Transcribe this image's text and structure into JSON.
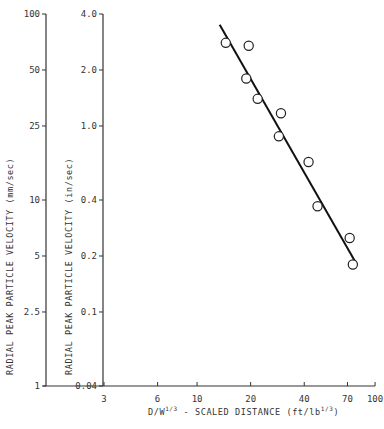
{
  "chart_data": {
    "type": "scatter",
    "title": "",
    "xlabel": "D/W^(1/3) - SCALED DISTANCE (ft/lb^(1/3))",
    "ylabel_left": "RADIAL PEAK PARTICLE VELOCITY (mm/sec)",
    "ylabel_right": "RADIAL PEAK PARTICLE VELOCITY (in/sec)",
    "xscale": "log",
    "yscale": "log",
    "xlim": [
      3,
      100
    ],
    "ylim_in_per_sec": [
      0.04,
      4.0
    ],
    "ylim_mm_per_sec": [
      1,
      100
    ],
    "x_ticks": [
      "3",
      "6",
      "10",
      "20",
      "40",
      "70",
      "100"
    ],
    "y_ticks_left": [
      "100",
      "50",
      "25",
      "10",
      "5",
      "2.5",
      "1"
    ],
    "y_ticks_right": [
      "4.0",
      "2.0",
      "1.0",
      "0.4",
      "0.2",
      "0.1",
      "0.04"
    ],
    "grid": false,
    "legend": null,
    "series": [
      {
        "name": "Measured data",
        "marker": "open-circle",
        "points": [
          {
            "x": 14.5,
            "y": 2.8
          },
          {
            "x": 19.5,
            "y": 2.7
          },
          {
            "x": 18.9,
            "y": 1.8
          },
          {
            "x": 21.9,
            "y": 1.4
          },
          {
            "x": 29.6,
            "y": 1.17
          },
          {
            "x": 28.8,
            "y": 0.88
          },
          {
            "x": 42.3,
            "y": 0.64
          },
          {
            "x": 47.5,
            "y": 0.37
          },
          {
            "x": 72.0,
            "y": 0.25
          },
          {
            "x": 75.0,
            "y": 0.18
          }
        ]
      },
      {
        "name": "Fit line",
        "type": "line",
        "points": [
          {
            "x": 13.4,
            "y": 3.5
          },
          {
            "x": 79,
            "y": 0.18
          }
        ]
      }
    ]
  },
  "labels": {
    "x_axis_prefix": "D/W",
    "x_axis_exp": "1/3",
    "x_axis_mid": " - SCALED DISTANCE (ft/lb",
    "x_axis_suffix": ")",
    "y_left": "RADIAL PEAK PARTICLE VELOCITY (mm/sec)",
    "y_right": "RADIAL PEAK PARTICLE VELOCITY (in/sec)"
  }
}
